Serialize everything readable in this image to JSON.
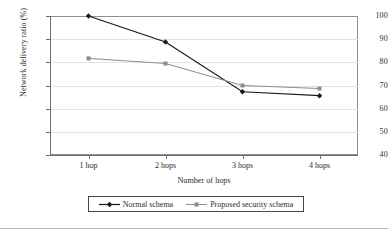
{
  "chart_data": {
    "type": "line",
    "title": "",
    "xlabel": "Number of hops",
    "ylabel": "Network delivery ratio (%)",
    "categories": [
      "1 hop",
      "2 hops",
      "3 hops",
      "4 hops"
    ],
    "ylim": [
      40,
      100
    ],
    "yticks": [
      40,
      50,
      60,
      70,
      80,
      90,
      100
    ],
    "ytick_labels": [
      "40",
      "50",
      "60",
      "70",
      "80",
      "90",
      "100"
    ],
    "grid": "horizontal",
    "legend_position": "bottom-center",
    "series": [
      {
        "name": "Normal schema",
        "marker": "diamond",
        "color": "#1a1a1a",
        "values": [
          100.0,
          88.8,
          67.3,
          65.6
        ]
      },
      {
        "name": "Proposed security schema",
        "marker": "square",
        "color": "#8c8c8c",
        "values": [
          81.7,
          79.5,
          70.0,
          68.7
        ]
      }
    ]
  },
  "colors": {
    "series_normal": "#1a1a1a",
    "series_proposed": "#8c8c8c",
    "frame": "#8f8f8f",
    "gridline": "#e3e3e3",
    "axis": "#6f6f6f",
    "text": "#2b2b2b",
    "legend_border": "#4a4a4a",
    "bottom_rule": "#b9b9b9"
  }
}
